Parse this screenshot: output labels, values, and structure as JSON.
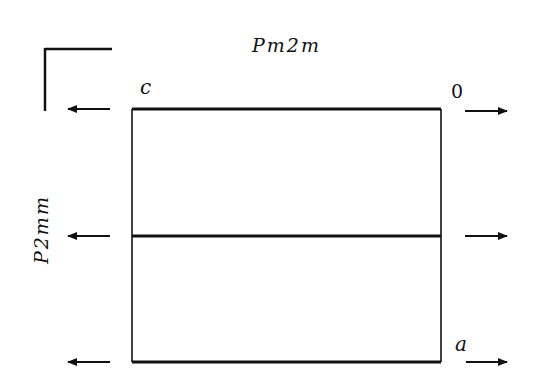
{
  "diagram": {
    "title_top": "Pm2m",
    "title_side": "P2mm",
    "corner_labels": {
      "top_left": "c",
      "top_right": "0",
      "bottom_right": "a"
    },
    "colors": {
      "line": "#111111",
      "background": "#ffffff"
    },
    "arrows": [
      {
        "row": "top",
        "left_direction": "left",
        "right_direction": "right"
      },
      {
        "row": "middle",
        "left_direction": "left",
        "right_direction": "right"
      },
      {
        "row": "bottom",
        "left_direction": "left",
        "right_direction": "right"
      }
    ]
  }
}
